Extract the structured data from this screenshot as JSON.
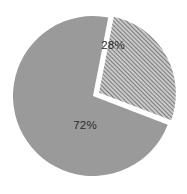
{
  "chart_data": {
    "type": "pie",
    "title": "",
    "subtitle": "",
    "xlabel": "",
    "ylabel": "",
    "categories": [
      "72%",
      "28%"
    ],
    "values": [
      72,
      28
    ],
    "slices": [
      {
        "label": "72%",
        "value": 72,
        "fill_style": "solid",
        "color": "#9a9a9a",
        "exploded": false,
        "start_angle_deg": 21,
        "end_angle_deg": 281,
        "label_x": 85,
        "label_y": 126
      },
      {
        "label": "28%",
        "value": 28,
        "fill_style": "diagonal-hatch",
        "color": "#9a9a9a",
        "hatch_angle_deg": 45,
        "hatch_spacing_px": 3,
        "exploded": true,
        "start_angle_deg": 281,
        "end_angle_deg": 381,
        "label_x": 113,
        "label_y": 46
      }
    ],
    "legend": [],
    "legend_position": "none",
    "grid": false,
    "background_color": "#ffffff",
    "label_color": "#2b2b2b",
    "geometry": {
      "center_x": 93,
      "center_y": 96,
      "radius": 80,
      "explode_offset_px": 5,
      "separator_color": "#ffffff"
    }
  }
}
